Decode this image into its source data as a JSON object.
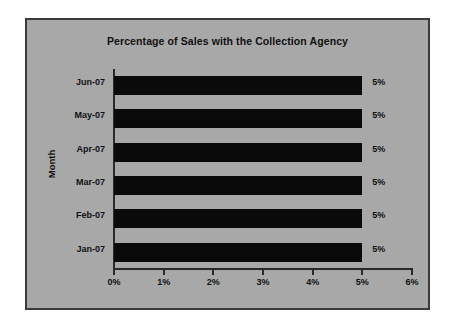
{
  "chart_data": {
    "type": "bar",
    "orientation": "horizontal",
    "title": "Percentage of Sales with the Collection Agency",
    "xlabel": "",
    "ylabel": "Month",
    "categories": [
      "Jun-07",
      "May-07",
      "Apr-07",
      "Mar-07",
      "Feb-07",
      "Jan-07"
    ],
    "values": [
      5,
      5,
      5,
      5,
      5,
      5
    ],
    "data_labels": [
      "5%",
      "5%",
      "5%",
      "5%",
      "5%",
      "5%"
    ],
    "xlim": [
      0,
      6
    ],
    "xticks": [
      0,
      1,
      2,
      3,
      4,
      5,
      6
    ],
    "xtick_labels": [
      "0%",
      "1%",
      "2%",
      "3%",
      "4%",
      "5%",
      "6%"
    ],
    "grid": false,
    "legend": null,
    "colors": {
      "bar": "#0a0a0a",
      "background": "#a8a8a8",
      "frame_border": "#3a3a3a",
      "axis": "#2a2a2a",
      "text": "#111111"
    }
  }
}
